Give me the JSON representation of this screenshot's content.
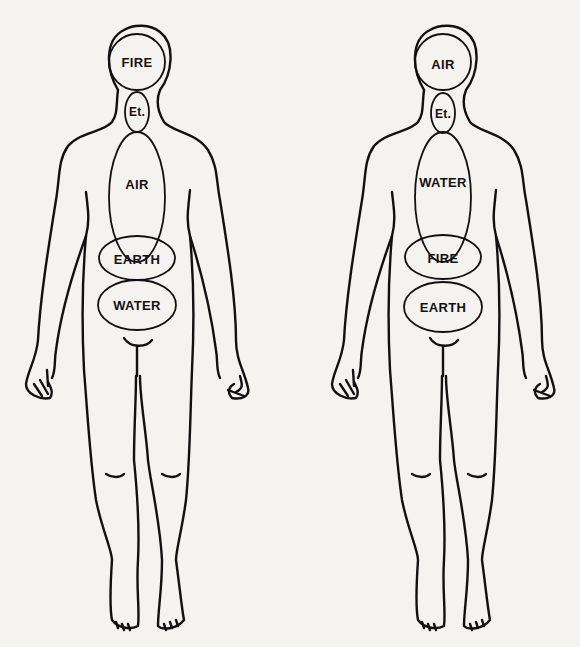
{
  "diagram": {
    "type": "body-element-zones",
    "stroke_color": "#111111",
    "background_color": "#f4f3f0",
    "figures": [
      {
        "id": "left",
        "zones": [
          {
            "label": "FIRE",
            "region": "head"
          },
          {
            "label": "Et.",
            "region": "throat"
          },
          {
            "label": "AIR",
            "region": "chest"
          },
          {
            "label": "EARTH",
            "region": "upper-abdomen"
          },
          {
            "label": "WATER",
            "region": "lower-abdomen"
          }
        ]
      },
      {
        "id": "right",
        "zones": [
          {
            "label": "AIR",
            "region": "head"
          },
          {
            "label": "Et.",
            "region": "throat"
          },
          {
            "label": "WATER",
            "region": "chest"
          },
          {
            "label": "FIRE",
            "region": "upper-abdomen"
          },
          {
            "label": "EARTH",
            "region": "lower-abdomen"
          }
        ]
      }
    ]
  }
}
